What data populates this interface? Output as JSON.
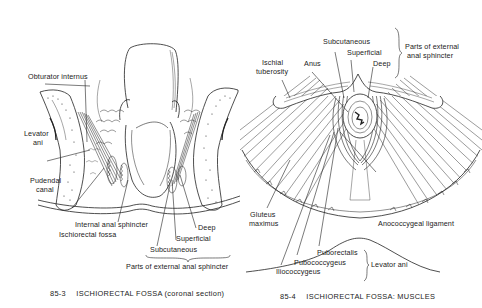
{
  "figures": [
    {
      "id": "85-3",
      "caption": {
        "number": "85-3",
        "title": "ISCHIORECTAL FOSSA",
        "subtitle": "(coronal section)"
      },
      "labels": {
        "obturator_internus": "Obturator internus",
        "levator_ani_1": "Levator",
        "levator_ani_2": "ani",
        "pudendal_canal_1": "Pudendal",
        "pudendal_canal_2": "canal",
        "internal_anal_sphincter": "Internal anal sphincter",
        "ischiorectal_fossa": "Ischiorectal fossa",
        "deep": "Deep",
        "superficial": "Superficial",
        "subcutaneous": "Subcutaneous",
        "parts_group": "Parts of external anal sphincter"
      }
    },
    {
      "id": "85-4",
      "caption": {
        "number": "85-4",
        "title": "ISCHIORECTAL FOSSA: MUSCLES",
        "subtitle": ""
      },
      "labels": {
        "subcutaneous": "Subcutaneous",
        "superficial": "Superficial",
        "deep": "Deep",
        "parts_group_1": "Parts of external",
        "parts_group_2": "anal sphincter",
        "ischial_tuberosity_1": "Ischial",
        "ischial_tuberosity_2": "tuberosity",
        "anus": "Anus",
        "gluteus_maximus_1": "Gluteus",
        "gluteus_maximus_2": "maximus",
        "anococcygeal_ligament": "Anococcygeal ligament",
        "puborectalis": "Puborectalis",
        "pubococcygeus": "Pubococcygeus",
        "iliococcygeus": "Iliococcygeus",
        "levator_group": "Levator ani"
      }
    }
  ]
}
